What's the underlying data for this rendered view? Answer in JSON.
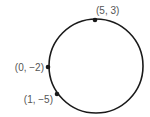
{
  "diagram": {
    "type": "circle-with-points",
    "circle": {
      "cx": 96,
      "cy": 66,
      "r": 47,
      "stroke": "#1a1a1a"
    },
    "points": [
      {
        "label": "(5, 3)",
        "x": 95,
        "y": 20,
        "label_x": 96,
        "label_y": 14,
        "anchor": "start"
      },
      {
        "label": "(0, −2)",
        "x": 48,
        "y": 67,
        "label_x": 44,
        "label_y": 71,
        "anchor": "end"
      },
      {
        "label": "(1, −5)",
        "x": 57,
        "y": 94,
        "label_x": 53,
        "label_y": 103,
        "anchor": "end"
      }
    ],
    "point_color": "#1a1a1a",
    "label_color": "#555555"
  }
}
